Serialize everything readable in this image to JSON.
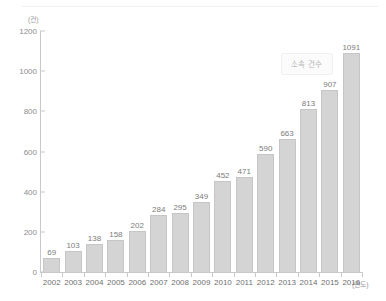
{
  "chart_data": {
    "type": "bar",
    "title": "",
    "subtitle": "",
    "xlabel": "(연도)",
    "ylabel": "(건)",
    "ylim": [
      0,
      1200
    ],
    "yticks": [
      0,
      200,
      400,
      600,
      800,
      1000,
      1200
    ],
    "grid": false,
    "legend_position": "inside-top-right",
    "legend": [
      "소속 건수"
    ],
    "categories": [
      "2002",
      "2003",
      "2004",
      "2005",
      "2006",
      "2007",
      "2008",
      "2009",
      "2010",
      "2011",
      "2012",
      "2013",
      "2014",
      "2015",
      "2016"
    ],
    "values": [
      69,
      103,
      138,
      158,
      202,
      284,
      295,
      349,
      452,
      471,
      590,
      663,
      813,
      907,
      1091
    ],
    "data_labels": [
      "69",
      "103",
      "138",
      "158",
      "202",
      "284",
      "295",
      "349",
      "452",
      "471",
      "590",
      "663",
      "813",
      "907",
      "1091"
    ],
    "series": [
      {
        "name": "소속 건수",
        "values": [
          69,
          103,
          138,
          158,
          202,
          284,
          295,
          349,
          452,
          471,
          590,
          663,
          813,
          907,
          1091
        ]
      }
    ]
  },
  "axes": {
    "y_unit_label": "(건)",
    "x_unit_label": "(연도)",
    "y_tick_labels": [
      "1200",
      "1000",
      "800",
      "600",
      "400",
      "200",
      "0"
    ]
  },
  "legend": {
    "label": "소속 건수"
  },
  "colors": {
    "bar_fill": "#d4d4d4",
    "bar_stroke": "#c6c6c6",
    "axis": "#c9c9c9",
    "label_text": "#7c7c7c",
    "background": "#ffffff"
  }
}
